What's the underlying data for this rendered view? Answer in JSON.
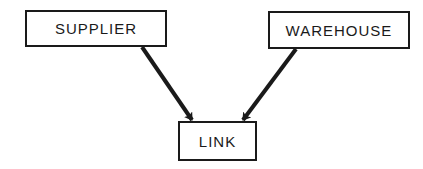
{
  "diagram": {
    "nodes": [
      {
        "id": "supplier",
        "label": "SUPPLIER",
        "x": 25,
        "y": 10,
        "w": 142,
        "h": 37
      },
      {
        "id": "warehouse",
        "label": "WAREHOUSE",
        "x": 268,
        "y": 11,
        "w": 142,
        "h": 38
      },
      {
        "id": "link",
        "label": "LINK",
        "x": 178,
        "y": 121,
        "w": 79,
        "h": 40
      }
    ],
    "edges": [
      {
        "from": "supplier",
        "to": "link"
      },
      {
        "from": "warehouse",
        "to": "link"
      }
    ],
    "colors": {
      "stroke": "#1a1a1a",
      "background": "#ffffff"
    }
  }
}
